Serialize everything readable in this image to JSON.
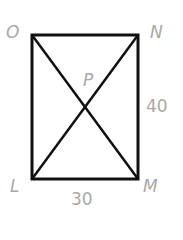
{
  "diagram": {
    "type": "rectangle-with-diagonals",
    "vertices": {
      "O": "O",
      "N": "N",
      "M": "M",
      "L": "L"
    },
    "intersection": "P",
    "side_lengths": {
      "NM": "40",
      "LM": "30"
    },
    "colors": {
      "stroke": "#111111",
      "label": "#a8a8a8"
    }
  }
}
